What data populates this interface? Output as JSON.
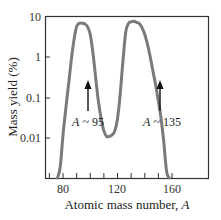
{
  "chart_data": {
    "type": "line",
    "title": "",
    "xlabel": "Atomic mass number, ",
    "xlabel_italic": "A",
    "ylabel": "Mass yield (%)",
    "xlim": [
      67,
      187
    ],
    "ylim_log10": [
      -3.98,
      1
    ],
    "y_scale": "log",
    "x_ticks_major": [
      80,
      120,
      160
    ],
    "x_ticks_minor": [
      70,
      80,
      90,
      100,
      110,
      120,
      130,
      140,
      150,
      160
    ],
    "y_ticks": [
      10,
      1,
      0.1,
      0.01
    ],
    "y_tick_labels": [
      "10",
      "1",
      "0.1",
      "0.01"
    ],
    "grid": false,
    "legend": null,
    "series": [
      {
        "name": "Fission fragment mass yield",
        "color": "#7a7a7a",
        "x": [
          76,
          78,
          80,
          82,
          84,
          86,
          88,
          90,
          92,
          94,
          96,
          98,
          100,
          102,
          104,
          106,
          108,
          110,
          112,
          114,
          116,
          118,
          120,
          122,
          124,
          126,
          128,
          130,
          132,
          134,
          136,
          138,
          140,
          142,
          144,
          146,
          148,
          150,
          152,
          154,
          156,
          158
        ],
        "y": [
          0.0001,
          0.002,
          0.012,
          0.05,
          0.2,
          0.8,
          2.5,
          5.5,
          6.6,
          6.6,
          6.4,
          5.5,
          3.5,
          1.2,
          0.3,
          0.08,
          0.03,
          0.015,
          0.011,
          0.011,
          0.012,
          0.015,
          0.03,
          0.12,
          0.8,
          4.0,
          6.5,
          7.2,
          7.4,
          7.0,
          6.5,
          5.2,
          3.5,
          2.0,
          1.0,
          0.45,
          0.2,
          0.08,
          0.03,
          0.008,
          0.0015,
          0.0001
        ]
      }
    ],
    "annotations": [
      {
        "text_italic": "A",
        "text": " ~ 95",
        "x": 95,
        "y_label": 0.04,
        "arrow_from": 0.09,
        "arrow_to": 0.45
      },
      {
        "text_italic": "A",
        "text": " ~ 135",
        "x": 135,
        "y_label": 0.04,
        "arrow_from": 0.09,
        "arrow_to": 0.45
      }
    ]
  },
  "labels": {
    "y_title": "Mass yield (%)",
    "x_title_prefix": "Atomic mass number, ",
    "x_title_var": "A",
    "peak1_var": "A",
    "peak1_text": " ~ 95",
    "peak2_var": "A",
    "peak2_text": " ~ 135",
    "xtick_80": "80",
    "xtick_120": "120",
    "xtick_160": "160",
    "ytick_10": "10",
    "ytick_1": "1",
    "ytick_01": "0.1",
    "ytick_001": "0.01"
  }
}
